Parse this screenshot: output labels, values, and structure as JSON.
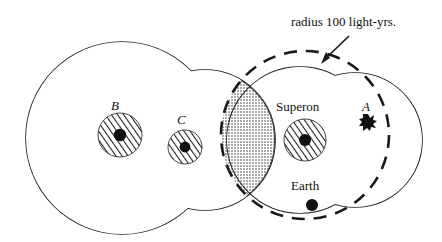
{
  "figure": {
    "title_text": "radius 100 light-yrs.",
    "stroke_color": "#1a1a1a",
    "fill_color": "#ffffff",
    "labels": {
      "star_b": "B",
      "star_c": "C",
      "star_a": "A",
      "superon": "Superon",
      "earth": "Earth",
      "radius_annotation": "radius 100 light-yrs."
    },
    "annotations": {
      "radius_value": "100",
      "radius_units": "light-yrs."
    },
    "objects": [
      {
        "name": "star-b",
        "label": "B",
        "cx": 120,
        "cy": 135,
        "halo_radius": 22,
        "core_radius": 6,
        "style": "hatched-disc"
      },
      {
        "name": "star-c",
        "label": "C",
        "cx": 185,
        "cy": 147,
        "halo_radius": 17,
        "core_radius": 5,
        "style": "hatched-disc"
      },
      {
        "name": "star-superon",
        "label": "Superon",
        "cx": 305,
        "cy": 140,
        "halo_radius": 21,
        "core_radius": 6,
        "style": "hatched-disc"
      },
      {
        "name": "star-a",
        "label": "A",
        "cx": 368,
        "cy": 122,
        "halo_radius": 7,
        "core_radius": 5,
        "style": "small-blob"
      },
      {
        "name": "earth",
        "label": "Earth",
        "cx": 312,
        "cy": 205,
        "core_radius": 6,
        "style": "solid-dot"
      }
    ],
    "regions": [
      {
        "name": "left-large-circle",
        "cx": 122,
        "cy": 138,
        "r": 96,
        "stroke": "solid"
      },
      {
        "name": "left-small-circle",
        "cx": 205,
        "cy": 140,
        "r": 70,
        "stroke": "solid"
      },
      {
        "name": "superon-circle",
        "cx": 300,
        "cy": 140,
        "r": 73,
        "stroke": "solid"
      },
      {
        "name": "right-circle",
        "cx": 355,
        "cy": 140,
        "r": 67,
        "stroke": "solid"
      },
      {
        "name": "radius-100-circle",
        "cx": 305,
        "cy": 135,
        "r": 84,
        "stroke": "dashed"
      },
      {
        "name": "overlap-lens",
        "style": "stippled"
      }
    ]
  }
}
